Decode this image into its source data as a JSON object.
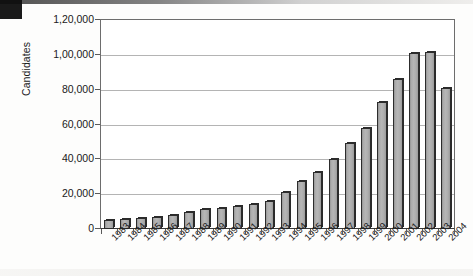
{
  "artifacts": {
    "scan_mark": "black-corner-mark",
    "top_edge_smudge": "scan-edge-smudge"
  },
  "chart_data": {
    "type": "bar",
    "title": "",
    "xlabel": "",
    "ylabel": "Candidates",
    "ylim": [
      0,
      120000
    ],
    "ytick_values": [
      0,
      20000,
      40000,
      60000,
      80000,
      100000,
      120000
    ],
    "ytick_labels": [
      "0",
      "20,000",
      "40,000",
      "60,000",
      "80,000",
      "1,00,000",
      "1,20,000"
    ],
    "grid": true,
    "legend": "none",
    "number_format": "indian",
    "categories": [
      "1983",
      "1984",
      "1985",
      "1986",
      "1987",
      "1988",
      "1989",
      "1990",
      "1991",
      "1992",
      "1993",
      "1994",
      "1995",
      "1996",
      "1997",
      "1998",
      "1999",
      "2000",
      "2001",
      "2002",
      "2003",
      "2004"
    ],
    "values": [
      5000,
      6000,
      6500,
      7000,
      8000,
      10000,
      11500,
      12000,
      13500,
      14500,
      16000,
      21500,
      27500,
      33000,
      40000,
      49500,
      58000,
      73000,
      86000,
      101000,
      101500,
      81000
    ],
    "bar_color": "#b0b0b0",
    "bar_edge_color": "#2c2c2c",
    "plot_background": "#ffffff",
    "gridline_color": "#b4b4b4"
  }
}
